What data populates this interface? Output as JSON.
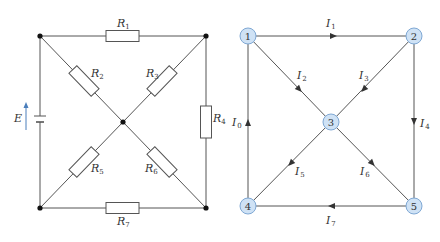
{
  "circuit": {
    "source": {
      "label": "E",
      "arrow_color": "#4a7ebb"
    },
    "resistors": [
      {
        "id": "R1",
        "label": "R",
        "sub": "1"
      },
      {
        "id": "R2",
        "label": "R",
        "sub": "2"
      },
      {
        "id": "R3",
        "label": "R",
        "sub": "3"
      },
      {
        "id": "R4",
        "label": "R",
        "sub": "4"
      },
      {
        "id": "R5",
        "label": "R",
        "sub": "5"
      },
      {
        "id": "R6",
        "label": "R",
        "sub": "6"
      },
      {
        "id": "R7",
        "label": "R",
        "sub": "7"
      }
    ]
  },
  "graph": {
    "nodes": [
      {
        "id": "1",
        "label": "1"
      },
      {
        "id": "2",
        "label": "2"
      },
      {
        "id": "3",
        "label": "3"
      },
      {
        "id": "4",
        "label": "4"
      },
      {
        "id": "5",
        "label": "5"
      }
    ],
    "node_fill": "#cfe2f5",
    "node_stroke": "#7fa8d4",
    "edges": [
      {
        "id": "I1",
        "label": "I",
        "sub": "1",
        "from": "1",
        "to": "2"
      },
      {
        "id": "I2",
        "label": "I",
        "sub": "2",
        "from": "1",
        "to": "3"
      },
      {
        "id": "I3",
        "label": "I",
        "sub": "3",
        "from": "2",
        "to": "3"
      },
      {
        "id": "I4",
        "label": "I",
        "sub": "4",
        "from": "2",
        "to": "5"
      },
      {
        "id": "I5",
        "label": "I",
        "sub": "5",
        "from": "3",
        "to": "4"
      },
      {
        "id": "I6",
        "label": "I",
        "sub": "6",
        "from": "3",
        "to": "5"
      },
      {
        "id": "I7",
        "label": "I",
        "sub": "7",
        "from": "5",
        "to": "4"
      },
      {
        "id": "I0",
        "label": "I",
        "sub": "0",
        "from": "4",
        "to": "1"
      }
    ]
  }
}
